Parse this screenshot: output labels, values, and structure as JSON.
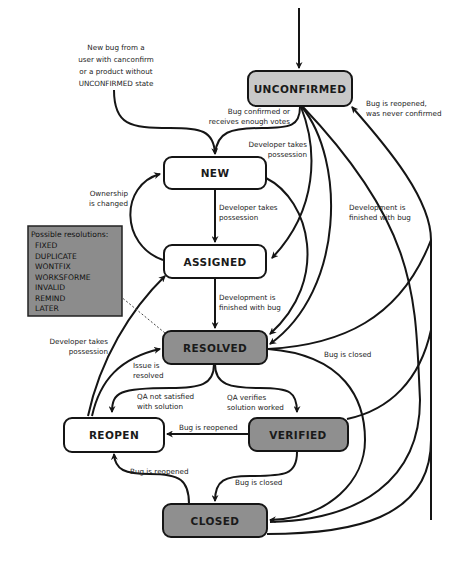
{
  "diagram": {
    "colors": {
      "background": "#ffffff",
      "node_white": "#ffffff",
      "node_light_gray": "#c8c8c8",
      "node_dark_gray": "#8f8f8f",
      "resolutions_box": "#8c8c8c",
      "stroke": "#151515"
    },
    "nodes": {
      "unconfirmed": "UNCONFIRMED",
      "new": "NEW",
      "assigned": "ASSIGNED",
      "resolved": "RESOLVED",
      "reopen": "REOPEN",
      "verified": "VERIFIED",
      "closed": "CLOSED"
    },
    "entry_note": [
      "New bug from a",
      "user with canconfirm",
      "or a product without",
      "UNCONFIRMED state"
    ],
    "resolutions": {
      "heading": "Possible resolutions:",
      "items": [
        "FIXED",
        "DUPLICATE",
        "WONTFIX",
        "WORKSFORME",
        "INVALID",
        "REMIND",
        "LATER"
      ]
    },
    "edge_labels": {
      "unconfirmed_to_new": [
        "Bug confirmed or",
        "receives enough votes"
      ],
      "unconfirmed_to_assigned": [
        "Developer takes",
        "possession"
      ],
      "unconfirmed_to_resolved": [
        "Development is",
        "finished with bug"
      ],
      "reopened_never_confirmed": [
        "Bug is reopened,",
        "was never confirmed"
      ],
      "new_to_assigned": [
        "Developer takes",
        "possession"
      ],
      "assigned_to_new": [
        "Ownership",
        "is changed"
      ],
      "assigned_to_resolved": [
        "Development is",
        "finished with bug"
      ],
      "reopen_to_assigned": [
        "Developer takes",
        "possession"
      ],
      "reopen_to_resolved": [
        "Issue is",
        "resolved"
      ],
      "resolved_to_reopen": [
        "QA not satisfied",
        "with solution"
      ],
      "resolved_to_verified": [
        "QA verifies",
        "solution worked"
      ],
      "resolved_to_closed": [
        "Bug is closed"
      ],
      "verified_to_reopen": [
        "Bug is reopened"
      ],
      "verified_to_closed": [
        "Bug is closed"
      ],
      "closed_to_reopen": [
        "Bug is reopened"
      ]
    }
  }
}
